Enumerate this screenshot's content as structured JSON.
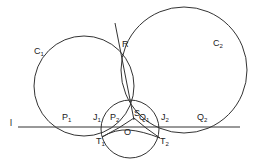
{
  "diagram": {
    "title": "",
    "stroke_color": "#333333",
    "line_label": "l",
    "circles": [
      {
        "name": "C",
        "sub": "1",
        "cx": 84,
        "cy": 86,
        "r": 50
      },
      {
        "name": "C",
        "sub": "2",
        "cx": 184,
        "cy": 70,
        "r": 63
      },
      {
        "name": "",
        "sub": "",
        "cx": 130,
        "cy": 129,
        "r": 29
      }
    ],
    "points": [
      {
        "name": "R",
        "sub": ""
      },
      {
        "name": "S",
        "sub": ""
      },
      {
        "name": "P",
        "sub": "1"
      },
      {
        "name": "J",
        "sub": "1"
      },
      {
        "name": "P",
        "sub": "2"
      },
      {
        "name": "O",
        "sub": ""
      },
      {
        "name": "Q",
        "sub": "1"
      },
      {
        "name": "J",
        "sub": "2"
      },
      {
        "name": "Q",
        "sub": "2"
      },
      {
        "name": "T",
        "sub": "1"
      },
      {
        "name": "T",
        "sub": "2"
      }
    ]
  }
}
